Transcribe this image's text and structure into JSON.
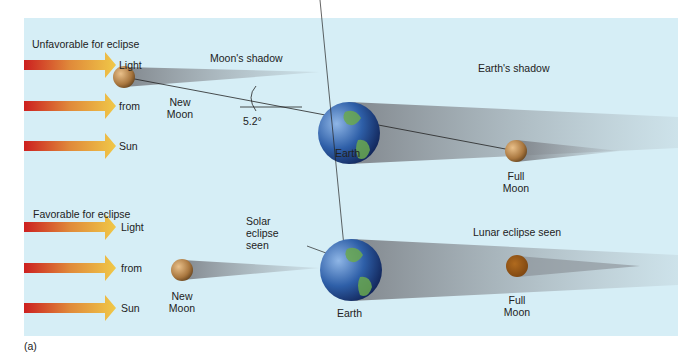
{
  "panel_label": "(a)",
  "top": {
    "heading": "Unfavorable for eclipse",
    "arrow_labels": [
      "Light",
      "from",
      "Sun"
    ],
    "moon_shadow_label": "Moon's shadow",
    "new_moon_label": [
      "New",
      "Moon"
    ],
    "angle_label": "5.2°",
    "earth_label": "Earth",
    "earth_shadow_label": "Earth's shadow",
    "full_moon_label": [
      "Full",
      "Moon"
    ]
  },
  "bottom": {
    "heading": "Favorable for eclipse",
    "arrow_labels": [
      "Light",
      "from",
      "Sun"
    ],
    "solar_eclipse_label": [
      "Solar",
      "eclipse",
      "seen"
    ],
    "new_moon_label": [
      "New",
      "Moon"
    ],
    "earth_label": "Earth",
    "lunar_eclipse_label": "Lunar eclipse seen",
    "full_moon_label": [
      "Full",
      "Moon"
    ]
  },
  "colors": {
    "background": "#d6eef6",
    "arrow_start": "#cc2020",
    "arrow_end": "#f0c040",
    "shadow": "#8a8f94",
    "moon": "#b98a55",
    "eclipsed_moon": "#9a5a1a"
  }
}
